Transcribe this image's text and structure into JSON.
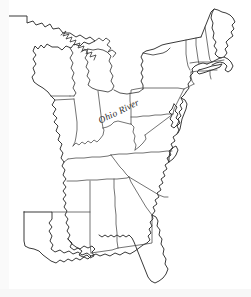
{
  "figure": {
    "kind": "outline-map",
    "width": 251,
    "height": 297,
    "background_color": "#ffffff",
    "line_color": "#2e2e2e",
    "border_color": "#454545",
    "style": "black-and-white line drawing, unlabeled except one river label"
  },
  "labels": [
    {
      "id": "ohio-river",
      "text": "Ohio River",
      "style": "italic-serif",
      "rotation_degrees": -26,
      "x": 99,
      "y": 116
    }
  ],
  "regions_depicted": [
    "Minnesota",
    "Wisconsin",
    "Michigan",
    "Illinois",
    "Indiana",
    "Ohio",
    "Kentucky",
    "Tennessee",
    "Mississippi",
    "Alabama",
    "Louisiana",
    "Georgia",
    "Florida",
    "South Carolina",
    "North Carolina",
    "Virginia",
    "West Virginia",
    "Maryland",
    "Delaware",
    "Pennsylvania",
    "New Jersey",
    "New York",
    "Connecticut",
    "Rhode Island",
    "Massachusetts",
    "Vermont",
    "New Hampshire",
    "Maine"
  ],
  "features_depicted": [
    "Great Lakes shoreline",
    "Atlantic coastline",
    "Gulf of Mexico coastline",
    "Chesapeake Bay",
    "Delmarva Peninsula",
    "Cape Cod",
    "Long Island",
    "Florida peninsula",
    "Mississippi River delta",
    "Ohio River"
  ]
}
